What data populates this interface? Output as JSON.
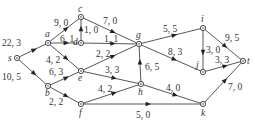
{
  "diagram": {
    "type": "flow-network",
    "nodes": [
      {
        "id": "s",
        "x": 17,
        "y": 58,
        "lx": 8,
        "ly": 61
      },
      {
        "id": "a",
        "x": 48,
        "y": 43,
        "lx": 45,
        "ly": 37
      },
      {
        "id": "b",
        "x": 48,
        "y": 86,
        "lx": 45,
        "ly": 96
      },
      {
        "id": "c",
        "x": 81,
        "y": 17,
        "lx": 78,
        "ly": 12
      },
      {
        "id": "d",
        "x": 81,
        "y": 43,
        "lx": 73,
        "ly": 45
      },
      {
        "id": "e",
        "x": 81,
        "y": 71,
        "lx": 78,
        "ly": 81
      },
      {
        "id": "f",
        "x": 81,
        "y": 104,
        "lx": 79,
        "ly": 116
      },
      {
        "id": "g",
        "x": 139,
        "y": 44,
        "lx": 136,
        "ly": 38
      },
      {
        "id": "h",
        "x": 141,
        "y": 84,
        "lx": 138,
        "ly": 95
      },
      {
        "id": "i",
        "x": 203,
        "y": 28,
        "lx": 201,
        "ly": 22
      },
      {
        "id": "j",
        "x": 203,
        "y": 72,
        "lx": 196,
        "ly": 68
      },
      {
        "id": "k",
        "x": 203,
        "y": 104,
        "lx": 201,
        "ly": 116
      },
      {
        "id": "t",
        "x": 243,
        "y": 61,
        "lx": 247,
        "ly": 64
      }
    ],
    "edges": [
      {
        "from": "s",
        "to": "a",
        "label": "22, 3",
        "lx": 2,
        "ly": 46
      },
      {
        "from": "s",
        "to": "b",
        "label": "10, 5",
        "lx": 2,
        "ly": 80
      },
      {
        "from": "a",
        "to": "c",
        "label": "9, 0",
        "lx": 54,
        "ly": 26
      },
      {
        "from": "a",
        "to": "d",
        "label": "6, 1",
        "lx": 60,
        "ly": 42
      },
      {
        "from": "a",
        "to": "e",
        "label": "4, 2",
        "lx": 46,
        "ly": 63
      },
      {
        "from": "d",
        "to": "c",
        "label": "1, 0",
        "lx": 84,
        "ly": 33
      },
      {
        "from": "c",
        "to": "g",
        "label": "7, 0",
        "lx": 103,
        "ly": 24
      },
      {
        "from": "d",
        "to": "g",
        "label": "1, 1",
        "lx": 104,
        "ly": 42
      },
      {
        "from": "e",
        "to": "g",
        "label": "2, 2",
        "lx": 96,
        "ly": 57
      },
      {
        "from": "b",
        "to": "e",
        "label": "6, 3",
        "lx": 49,
        "ly": 75
      },
      {
        "from": "b",
        "to": "f",
        "label": "2, 2",
        "lx": 49,
        "ly": 105
      },
      {
        "from": "e",
        "to": "h",
        "label": "3, 3",
        "lx": 105,
        "ly": 73
      },
      {
        "from": "h",
        "to": "g",
        "label": "6, 5",
        "lx": 145,
        "ly": 70
      },
      {
        "from": "f",
        "to": "h",
        "label": "4, 2",
        "lx": 98,
        "ly": 92
      },
      {
        "from": "f",
        "to": "k",
        "label": "5, 0",
        "lx": 136,
        "ly": 118
      },
      {
        "from": "g",
        "to": "i",
        "label": "5, 5",
        "lx": 163,
        "ly": 32
      },
      {
        "from": "g",
        "to": "j",
        "label": "8, 3",
        "lx": 168,
        "ly": 55
      },
      {
        "from": "h",
        "to": "k",
        "label": "4, 0",
        "lx": 166,
        "ly": 91
      },
      {
        "from": "i",
        "to": "j",
        "label": "3, 0",
        "lx": 206,
        "ly": 53
      },
      {
        "from": "i",
        "to": "t",
        "label": "9, 5",
        "lx": 225,
        "ly": 41
      },
      {
        "from": "j",
        "to": "t",
        "label": "3, 3",
        "lx": 215,
        "ly": 63
      },
      {
        "from": "k",
        "to": "t",
        "label": "7, 0",
        "lx": 228,
        "ly": 90
      }
    ]
  }
}
